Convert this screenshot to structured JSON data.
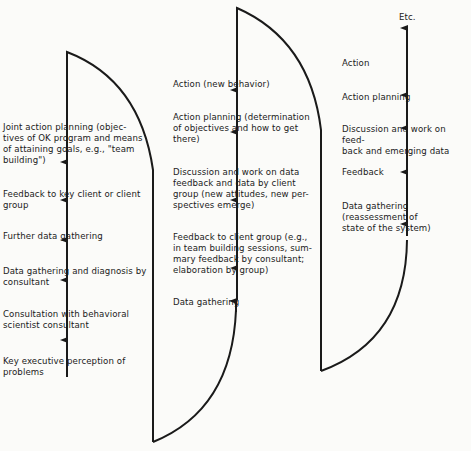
{
  "diagram": {
    "type": "action-research spiral flow",
    "stages": [
      {
        "id": "cycle-1",
        "steps": [
          "Key executive perception of\nproblems",
          "Consultation with behavioral\nscientist consultant",
          "Data gathering and diagnosis by\nconsultant",
          "Further data gathering",
          "Feedback to key client or client\ngroup",
          "Joint action planning (objec-\ntives of OK program and means\nof attaining goals, e.g., \"team\nbuilding\")"
        ]
      },
      {
        "id": "cycle-2",
        "steps": [
          "Data gathering",
          "Feedback to client group (e.g.,\nin team building sessions, sum-\nmary feedback by consultant;\nelaboration by group)",
          "Discussion and work on data\nfeedback and data by client\ngroup (new attitudes, new per-\nspectives emerge)",
          "Action planning (determination\nof objectives and how to get\nthere)",
          "Action (new behavior)"
        ]
      },
      {
        "id": "cycle-3",
        "steps": [
          "Data gathering (reassessment of\nstate of the system)",
          "Feedback",
          "Discussion and work on feed-\nback and emerging data",
          "Action planning",
          "Action",
          "Etc."
        ]
      }
    ],
    "colors": {
      "line": "#1a1a1a",
      "background": "#fbfbf9"
    }
  }
}
